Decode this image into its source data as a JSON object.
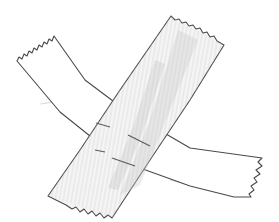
{
  "image": {
    "description": "Pencil sketch of two crossed strips of adhesive tape forming an X",
    "alt": "Two strips of tape crossed in an X shape, hand-drawn in pencil"
  },
  "strips": [
    {
      "name": "back-strip",
      "direction": "top-left to bottom-right",
      "fill": "#ffffff",
      "shading": "none"
    },
    {
      "name": "front-strip",
      "direction": "top-right to bottom-left",
      "fill": "#f4f4f4",
      "shading": "vertical pencil hatching"
    }
  ],
  "colors": {
    "background": "#ffffff",
    "outline": "#4a4a4a",
    "shading": "#bdbdbd",
    "shadow": "#d8d8d8"
  }
}
